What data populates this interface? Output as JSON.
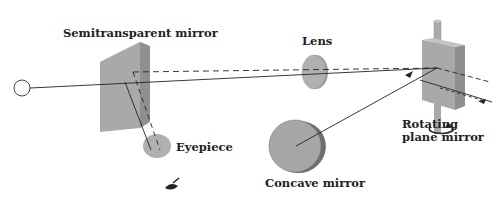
{
  "labels": {
    "semitransparent_mirror": "Semitransparent mirror",
    "lens": "Lens",
    "eyepiece": "Eyepiece",
    "concave_mirror": "Concave mirror",
    "rotating_line1": "Rotating",
    "rotating_line2": "plane mirror"
  },
  "colors": {
    "component_fill": "#a9a9a9",
    "component_dark": "#8f8f8f",
    "component_light": "#c4c4c4",
    "ray": "#222222",
    "text": "#222222"
  },
  "icons": [
    "light-source-icon",
    "eye-icon",
    "rotation-arrow-icon"
  ]
}
